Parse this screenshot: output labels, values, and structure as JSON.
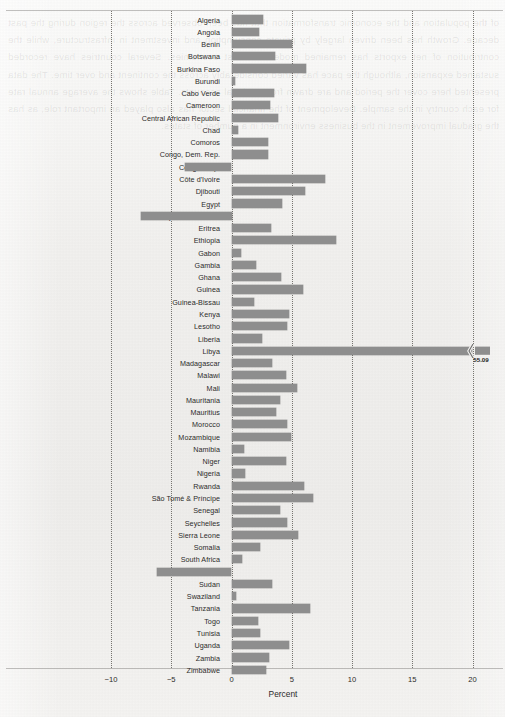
{
  "chart_data": {
    "type": "bar",
    "orientation": "horizontal",
    "title": "",
    "xlabel": "Percent",
    "ylabel": "",
    "xlim": [
      -11.5,
      21.5
    ],
    "xticks": [
      -10,
      -5,
      0,
      5,
      10,
      15,
      20
    ],
    "xtick_labels": [
      "−10",
      "−5",
      "0",
      "5",
      "10",
      "15",
      "20"
    ],
    "grid": "vertical dotted gridlines at each x tick",
    "legend": "none",
    "bar_color": "#8e8e8e",
    "axis_break": {
      "present": true,
      "category": "Libya",
      "displayed_value_label": "55.09",
      "note": "Libya bar is truncated at the right edge with a broken-axis squiggle marker"
    },
    "categories": [
      "Algeria",
      "Angola",
      "Benin",
      "Botswana",
      "Burkina Faso",
      "Burundi",
      "Cabo Verde",
      "Cameroon",
      "Central African Republic",
      "Chad",
      "Comoros",
      "Congo, Dem. Rep.",
      "Congo, Rep.",
      "Côte d'Ivoire",
      "Djibouti",
      "Egypt",
      "Equatorial Guinea",
      "Eritrea",
      "Ethiopia",
      "Gabon",
      "Gambia",
      "Ghana",
      "Guinea",
      "Guinea-Bissau",
      "Kenya",
      "Lesotho",
      "Liberia",
      "Libya",
      "Madagascar",
      "Malawi",
      "Mali",
      "Mauritania",
      "Mauritius",
      "Morocco",
      "Mozambique",
      "Namibia",
      "Niger",
      "Nigeria",
      "Rwanda",
      "São Tomé & Príncipe",
      "Senegal",
      "Seychelles",
      "Sierra Leone",
      "Somalia",
      "South Africa",
      "South Sudan",
      "Sudan",
      "Swaziland",
      "Tanzania",
      "Togo",
      "Tunisia",
      "Uganda",
      "Zambia",
      "Zimbabwe"
    ],
    "values": [
      2.6,
      2.3,
      5.0,
      3.6,
      6.2,
      0.3,
      3.5,
      3.2,
      3.9,
      0.5,
      3.0,
      3.0,
      -3.9,
      7.8,
      6.1,
      4.2,
      -7.5,
      3.3,
      8.7,
      0.8,
      2.0,
      4.1,
      5.9,
      1.9,
      4.8,
      4.6,
      2.5,
      55.09,
      3.4,
      4.5,
      5.4,
      4.0,
      3.7,
      4.6,
      4.9,
      1.0,
      4.5,
      1.1,
      6.0,
      6.8,
      4.0,
      4.6,
      5.5,
      2.4,
      0.9,
      -6.2,
      3.4,
      0.4,
      6.5,
      2.2,
      2.4,
      4.8,
      3.1,
      2.9
    ]
  },
  "bleed_through_text": "of the population and the economic transformation that has been observed across the region during the past decade. Growth has been driven largely by private consumption and investment in infrastructure, while the contribution of net exports has remained modest in most economies. Several countries have recorded sustained expansion, although the pace has varied considerably across the continent and over time. The data presented here cover the period and are drawn from national accounts. Table shows the average annual rate for each country in the sample. Development of the financial sector has also played an important role, as has the gradual improvement in the business environment in a number of states."
}
